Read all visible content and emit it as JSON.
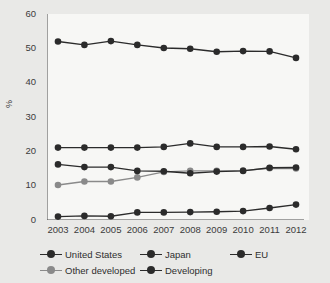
{
  "chart_data": {
    "type": "line",
    "title": "",
    "xlabel": "",
    "ylabel": "%",
    "categories": [
      "2003",
      "2004",
      "2005",
      "2006",
      "2007",
      "2008",
      "2009",
      "2010",
      "2011",
      "2012"
    ],
    "ylim": [
      0,
      60
    ],
    "yticks": [
      0,
      10,
      20,
      30,
      40,
      50,
      60
    ],
    "grid": false,
    "legend_position": "bottom",
    "series": [
      {
        "name": "United States",
        "color": "#2b2b2b",
        "values": [
          16.2,
          15.4,
          15.4,
          14.3,
          14.2,
          13.6,
          14.1,
          14.3,
          15.2,
          15.3
        ]
      },
      {
        "name": "Japan",
        "color": "#2b2b2b",
        "values": [
          21.1,
          21.1,
          21.1,
          21.1,
          21.3,
          22.3,
          21.3,
          21.3,
          21.4,
          20.6
        ]
      },
      {
        "name": "EU",
        "color": "#2b2b2b",
        "values": [
          52.0,
          51.0,
          52.1,
          51.0,
          50.1,
          49.9,
          49.0,
          49.2,
          49.1,
          47.2
        ]
      },
      {
        "name": "Other developed",
        "color": "#8a8a8a",
        "values": [
          10.2,
          11.2,
          11.2,
          12.4,
          14.0,
          14.3,
          14.3,
          14.4,
          15.1,
          15.0
        ]
      },
      {
        "name": "Developing",
        "color": "#2b2b2b",
        "values": [
          1.0,
          1.2,
          1.1,
          2.2,
          2.2,
          2.3,
          2.4,
          2.6,
          3.5,
          4.5
        ]
      }
    ]
  },
  "axis": {
    "y_label": "%",
    "y_ticks": [
      "0",
      "10",
      "20",
      "30",
      "40",
      "50",
      "60"
    ],
    "x_ticks": [
      "2003",
      "2004",
      "2005",
      "2006",
      "2007",
      "2008",
      "2009",
      "2010",
      "2011",
      "2012"
    ]
  },
  "legend": {
    "rows": [
      [
        {
          "label": "United States",
          "color": "#2b2b2b"
        },
        {
          "label": "Japan",
          "color": "#2b2b2b"
        },
        {
          "label": "EU",
          "color": "#2b2b2b"
        }
      ],
      [
        {
          "label": "Other developed",
          "color": "#8a8a8a"
        },
        {
          "label": "Developing",
          "color": "#2b2b2b"
        }
      ]
    ]
  },
  "colors": {
    "page_background": "#e9e9e7",
    "plot_background": "#f7f7f5",
    "axis": "#4a4a4a",
    "dark_series": "#2b2b2b",
    "gray_series": "#8a8a8a"
  }
}
